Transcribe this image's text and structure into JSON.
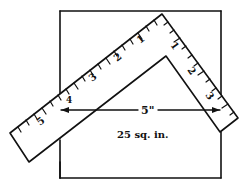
{
  "diagram": {
    "area_label": "25 sq. in.",
    "dimension_label": "5\"",
    "left_arm_numbers": [
      "1",
      "2",
      "3",
      "4",
      "5"
    ],
    "right_arm_numbers": [
      "1",
      "2",
      "3"
    ],
    "colors": {
      "ink": "#111111",
      "background": "#ffffff"
    }
  }
}
